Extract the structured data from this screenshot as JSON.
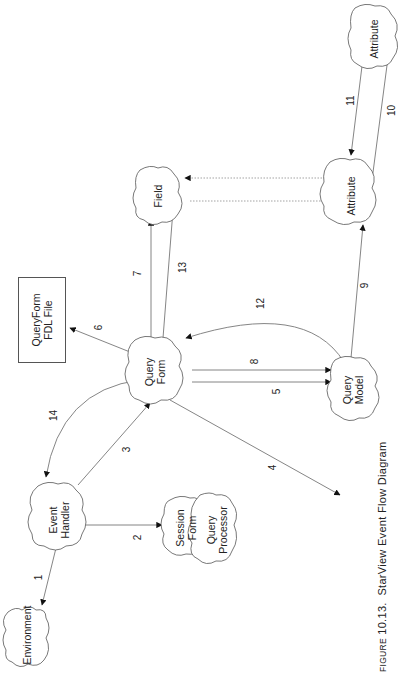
{
  "diagram": {
    "orientation": "rotated 90deg counter-clockwise",
    "nodes": {
      "environment": {
        "label": "Environment",
        "shape": "cloud"
      },
      "event_handler": {
        "line1": "Event",
        "line2": "Handler",
        "shape": "cloud"
      },
      "session_form": {
        "line1": "Session",
        "line2": "Form",
        "shape": "cloud"
      },
      "query_processor": {
        "line1": "Query",
        "line2": "Processor",
        "shape": "cloud"
      },
      "query_form": {
        "line1": "Query",
        "line2": "Form",
        "shape": "cloud"
      },
      "fdl_file": {
        "line1": "QueryForm",
        "line2": "FDL File",
        "shape": "rectangle"
      },
      "field": {
        "label": "Field",
        "shape": "cloud"
      },
      "query_model": {
        "line1": "Query",
        "line2": "Model",
        "shape": "cloud"
      },
      "attribute_1": {
        "label": "Attribute",
        "shape": "cloud"
      },
      "attribute_2": {
        "label": "Attribute",
        "shape": "cloud"
      }
    },
    "edges": [
      {
        "id": "1",
        "from": "Event Handler",
        "to": "Environment"
      },
      {
        "id": "2",
        "from": "Event Handler",
        "to": "Session Form"
      },
      {
        "id": "3",
        "from": "Event Handler",
        "to": "Query Form"
      },
      {
        "id": "4",
        "from": "Query Form",
        "to": "Query Processor"
      },
      {
        "id": "5",
        "from": "Query Form",
        "to": "Query Model"
      },
      {
        "id": "6",
        "from": "Query Form",
        "to": "QueryForm FDL File"
      },
      {
        "id": "7",
        "from": "Query Form",
        "to": "Field"
      },
      {
        "id": "8",
        "from": "Query Form",
        "to": "Query Model"
      },
      {
        "id": "9",
        "from": "Query Model",
        "to": "Attribute"
      },
      {
        "id": "10",
        "from": "Attribute",
        "to": "Attribute (child)"
      },
      {
        "id": "11",
        "from": "Attribute (child)",
        "to": "Attribute"
      },
      {
        "id": "12",
        "from": "Query Model",
        "to": "Query Form"
      },
      {
        "id": "13",
        "from": "Query Form",
        "to": "Field"
      },
      {
        "id": "14",
        "from": "Query Form",
        "to": "Event Handler"
      },
      {
        "id": "",
        "from": "Field",
        "to": "Attribute",
        "style": "dotted"
      },
      {
        "id": "",
        "from": "Attribute",
        "to": "Field",
        "style": "dotted"
      }
    ],
    "edge_labels": [
      "1",
      "2",
      "3",
      "4",
      "5",
      "6",
      "7",
      "8",
      "9",
      "10",
      "11",
      "12",
      "13",
      "14"
    ]
  },
  "caption": {
    "prefix": "Figure",
    "number": "10.13.",
    "title": "StarView Event Flow Diagram"
  }
}
